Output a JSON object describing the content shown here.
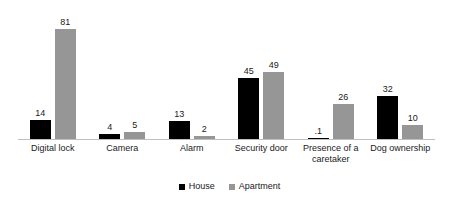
{
  "chart_data": {
    "type": "bar",
    "title": "",
    "subtitle": "",
    "xlabel": "",
    "ylabel": "",
    "ylim": [
      0,
      90
    ],
    "grid": false,
    "legend_position": "bottom",
    "categories": [
      "Digital lock",
      "Camera",
      "Alarm",
      "Security door",
      "Presence of a caretaker",
      "Dog ownership"
    ],
    "series": [
      {
        "name": "House",
        "color": "#000000",
        "values": [
          14,
          4,
          13,
          45,
          1,
          32
        ],
        "labels": [
          "14",
          "4",
          "13",
          "45",
          ".1",
          "32"
        ]
      },
      {
        "name": "Apartment",
        "color": "#969696",
        "values": [
          81,
          5,
          2,
          49,
          26,
          10
        ],
        "labels": [
          "81",
          "5",
          "2",
          "49",
          "26",
          "10"
        ]
      }
    ],
    "axis_color": "#bfbfbf"
  },
  "legend": {
    "items": [
      {
        "label": "House"
      },
      {
        "label": "Apartment"
      }
    ]
  }
}
